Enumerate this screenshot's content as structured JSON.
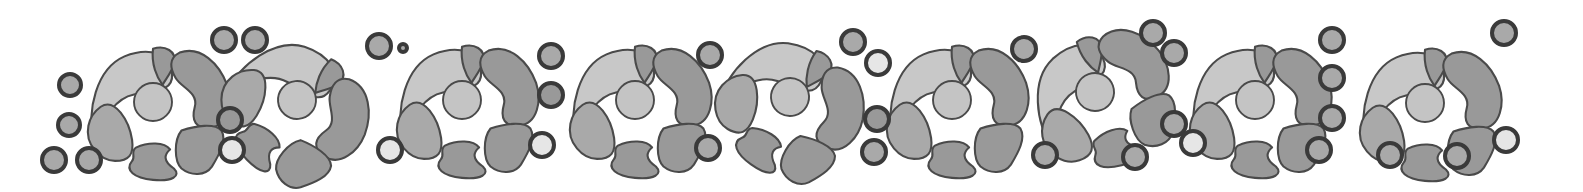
{
  "colors": {
    "background": "#ffffff",
    "stroke": "#4a4a4a",
    "ring_stroke": "#3a3a3a",
    "light_fill": "#c8c8c8",
    "mid_fill": "#a9a9a9",
    "dark_fill": "#999999",
    "center_fill": "#c4c4c4",
    "pale_fill": "#e6e6e6"
  },
  "rosettes": [
    {
      "cx": 153,
      "cy": 102,
      "rot": 0
    },
    {
      "cx": 297,
      "cy": 100,
      "rot": 40
    },
    {
      "cx": 462,
      "cy": 100,
      "rot": 0
    },
    {
      "cx": 635,
      "cy": 100,
      "rot": 0
    },
    {
      "cx": 790,
      "cy": 97,
      "rot": 30
    },
    {
      "cx": 952,
      "cy": 100,
      "rot": 0
    },
    {
      "cx": 1095,
      "cy": 92,
      "rot": -20
    },
    {
      "cx": 1255,
      "cy": 100,
      "rot": 0
    },
    {
      "cx": 1425,
      "cy": 103,
      "rot": 0
    }
  ],
  "rings": [
    {
      "cx": 70,
      "cy": 85,
      "r": 11,
      "fill": "mid"
    },
    {
      "cx": 69,
      "cy": 125,
      "r": 11,
      "fill": "mid"
    },
    {
      "cx": 54,
      "cy": 160,
      "r": 12,
      "fill": "mid"
    },
    {
      "cx": 89,
      "cy": 160,
      "r": 12,
      "fill": "mid"
    },
    {
      "cx": 224,
      "cy": 40,
      "r": 12,
      "fill": "mid"
    },
    {
      "cx": 255,
      "cy": 40,
      "r": 12,
      "fill": "mid"
    },
    {
      "cx": 379,
      "cy": 46,
      "r": 12,
      "fill": "mid"
    },
    {
      "cx": 230,
      "cy": 120,
      "r": 12,
      "fill": "dark"
    },
    {
      "cx": 232,
      "cy": 150,
      "r": 12,
      "fill": "pale"
    },
    {
      "cx": 390,
      "cy": 150,
      "r": 12,
      "fill": "pale"
    },
    {
      "cx": 403,
      "cy": 48,
      "r": 4,
      "fill": "mid"
    },
    {
      "cx": 551,
      "cy": 56,
      "r": 12,
      "fill": "mid"
    },
    {
      "cx": 551,
      "cy": 95,
      "r": 12,
      "fill": "dark"
    },
    {
      "cx": 542,
      "cy": 145,
      "r": 12,
      "fill": "pale"
    },
    {
      "cx": 710,
      "cy": 55,
      "r": 12,
      "fill": "mid"
    },
    {
      "cx": 708,
      "cy": 148,
      "r": 12,
      "fill": "mid"
    },
    {
      "cx": 853,
      "cy": 42,
      "r": 12,
      "fill": "mid"
    },
    {
      "cx": 878,
      "cy": 63,
      "r": 12,
      "fill": "pale"
    },
    {
      "cx": 877,
      "cy": 119,
      "r": 12,
      "fill": "dark"
    },
    {
      "cx": 874,
      "cy": 152,
      "r": 12,
      "fill": "mid"
    },
    {
      "cx": 1024,
      "cy": 49,
      "r": 12,
      "fill": "mid"
    },
    {
      "cx": 1045,
      "cy": 155,
      "r": 12,
      "fill": "mid"
    },
    {
      "cx": 1153,
      "cy": 33,
      "r": 12,
      "fill": "mid"
    },
    {
      "cx": 1174,
      "cy": 53,
      "r": 12,
      "fill": "mid"
    },
    {
      "cx": 1174,
      "cy": 124,
      "r": 12,
      "fill": "mid"
    },
    {
      "cx": 1135,
      "cy": 157,
      "r": 12,
      "fill": "mid"
    },
    {
      "cx": 1193,
      "cy": 143,
      "r": 12,
      "fill": "pale"
    },
    {
      "cx": 1319,
      "cy": 150,
      "r": 12,
      "fill": "mid"
    },
    {
      "cx": 1332,
      "cy": 40,
      "r": 12,
      "fill": "mid"
    },
    {
      "cx": 1332,
      "cy": 78,
      "r": 12,
      "fill": "mid"
    },
    {
      "cx": 1332,
      "cy": 118,
      "r": 12,
      "fill": "mid"
    },
    {
      "cx": 1390,
      "cy": 155,
      "r": 12,
      "fill": "mid"
    },
    {
      "cx": 1457,
      "cy": 156,
      "r": 12,
      "fill": "mid"
    },
    {
      "cx": 1504,
      "cy": 33,
      "r": 12,
      "fill": "mid"
    },
    {
      "cx": 1506,
      "cy": 140,
      "r": 12,
      "fill": "pale"
    }
  ]
}
